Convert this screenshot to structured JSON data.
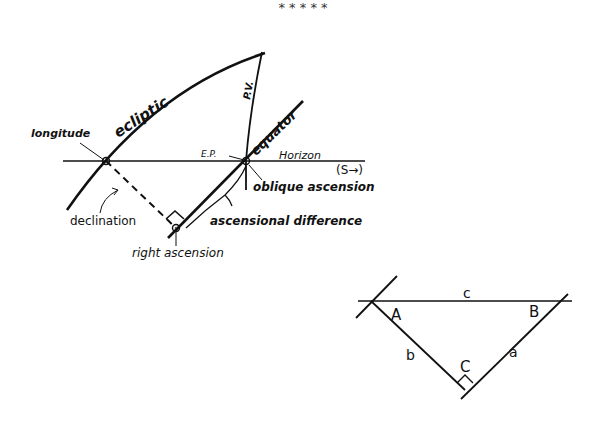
{
  "separator": {
    "text": "*   *   *   *   *"
  },
  "figure1": {
    "labels": {
      "ecliptic": "ecliptic",
      "pv": "P.V.",
      "equator": "equator",
      "longitude": "longitude",
      "ep": "E.P.",
      "horizon": "Horizon",
      "south": "(S→)",
      "oblique_ascension": "oblique ascension",
      "declination": "declination",
      "ascensional_difference": "ascensional difference",
      "right_ascension": "right ascension"
    }
  },
  "figure2": {
    "labels": {
      "vertex_a": "A",
      "vertex_b": "B",
      "vertex_c": "C",
      "side_a": "a",
      "side_b": "b",
      "side_c": "c"
    }
  },
  "colors": {
    "ink": "#111111",
    "background": "#ffffff"
  }
}
